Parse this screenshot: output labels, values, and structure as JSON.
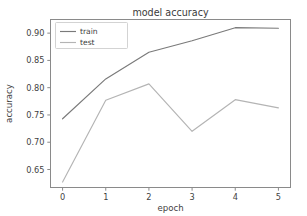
{
  "chart_data": {
    "type": "line",
    "title": "model accuracy",
    "xlabel": "epoch",
    "ylabel": "accuracy",
    "x": [
      0,
      1,
      2,
      3,
      4,
      5
    ],
    "xticklabels": [
      "0",
      "1",
      "2",
      "3",
      "4",
      "5"
    ],
    "yticks": [
      0.65,
      0.7,
      0.75,
      0.8,
      0.85,
      0.9
    ],
    "yticklabels": [
      "0.65",
      "0.70",
      "0.75",
      "0.80",
      "0.85",
      "0.90"
    ],
    "xlim": [
      -0.28,
      5.28
    ],
    "ylim": [
      0.617,
      0.925
    ],
    "grid": false,
    "legend_position": "upper left",
    "series": [
      {
        "name": "train",
        "color": "#7a7a7a",
        "values": [
          0.743,
          0.816,
          0.865,
          0.886,
          0.91,
          0.909
        ]
      },
      {
        "name": "test",
        "color": "#b4b4b4",
        "values": [
          0.627,
          0.777,
          0.807,
          0.72,
          0.778,
          0.763
        ]
      }
    ]
  },
  "figure": {
    "background": "#ffffff",
    "axes_color": "#8a8a8a",
    "text_color": "#3f3f3f"
  }
}
